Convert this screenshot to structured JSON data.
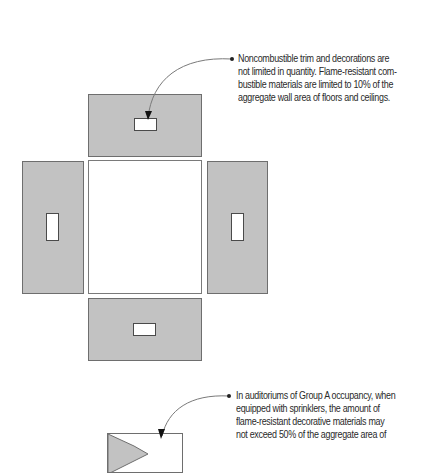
{
  "diagram": {
    "type": "unfolded-room-elevation",
    "panels": {
      "ceiling": {
        "label": "ceiling-panel",
        "fill": "#c2c2c2"
      },
      "floor": {
        "label": "floor-panel",
        "fill": "#c2c2c2"
      },
      "left_wall": {
        "label": "left-wall-panel",
        "fill": "#c2c2c2"
      },
      "right_wall": {
        "label": "right-wall-panel",
        "fill": "#c2c2c2"
      },
      "center": {
        "label": "room-plan",
        "fill": "#ffffff"
      }
    }
  },
  "notes": {
    "top": {
      "lines": [
        "Noncombustible trim and decorations are",
        "not limited in quantity. Flame-resistant com-",
        "bustible materials are limited to 10% of the",
        "aggregate wall area of floors and ceilings."
      ]
    },
    "bottom": {
      "lines": [
        "In auditoriums of Group A occupancy, when",
        "equipped with sprinklers, the amount of",
        "flame-resistant decorative materials may",
        "not exceed 50% of the aggregate area of"
      ]
    }
  },
  "colors": {
    "panel_fill": "#c2c2c2",
    "panel_stroke": "#6e6e6e",
    "leader_line": "#7a7a7a",
    "text": "#2a2a2a"
  }
}
